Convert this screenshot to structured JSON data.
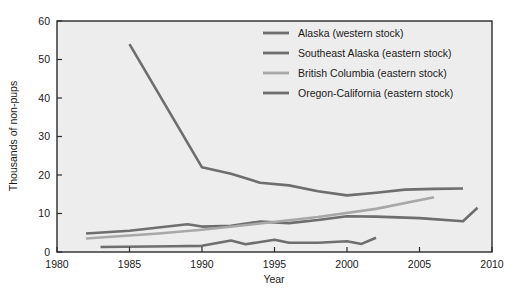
{
  "chart_data": {
    "type": "line",
    "title": "",
    "xlabel": "Year",
    "ylabel": "Thousands of non-pups",
    "xlim": [
      1980,
      2010
    ],
    "ylim": [
      0,
      60
    ],
    "xticks": [
      1980,
      1985,
      1990,
      1995,
      2000,
      2005,
      2010
    ],
    "yticks": [
      0,
      10,
      20,
      30,
      40,
      50,
      60
    ],
    "xtick_labels": [
      "1980",
      "1985",
      "1990",
      "1995",
      "2000",
      "2005",
      "2010"
    ],
    "ytick_labels": [
      "0",
      "10",
      "20",
      "30",
      "40",
      "50",
      "60"
    ],
    "grid": false,
    "legend_position": "upper-right-inside",
    "plot_background": "#ededed",
    "frame_color": "#2b2b2b",
    "series": [
      {
        "name": "Alaska (western stock)",
        "color": "#6e6e6e",
        "width": 2.6,
        "x": [
          1985,
          1990,
          1992,
          1994,
          1996,
          1998,
          2000,
          2002,
          2004,
          2006,
          2008
        ],
        "y": [
          54.0,
          22.0,
          20.3,
          18.0,
          17.3,
          15.8,
          14.7,
          15.4,
          16.2,
          16.4,
          16.5
        ]
      },
      {
        "name": "Southeast Alaska (eastern stock)",
        "color": "#6e6e6e",
        "width": 2.6,
        "x": [
          1982,
          1985,
          1989,
          1990,
          1992,
          1994,
          1996,
          1998,
          2000,
          2002,
          2005,
          2008,
          2009
        ],
        "y": [
          4.8,
          5.5,
          7.2,
          6.6,
          6.8,
          7.9,
          7.5,
          8.3,
          9.3,
          9.2,
          8.8,
          8.0,
          11.5
        ]
      },
      {
        "name": "British Columbia (eastern stock)",
        "color": "#a8a8a8",
        "width": 2.6,
        "x": [
          1982,
          1987,
          1990,
          1994,
          1998,
          2002,
          2006
        ],
        "y": [
          3.5,
          4.8,
          5.8,
          7.4,
          9.1,
          11.2,
          14.2
        ]
      },
      {
        "name": "Oregon-California (eastern stock)",
        "color": "#6e6e6e",
        "width": 2.6,
        "x": [
          1983,
          1988,
          1990,
          1992,
          1993,
          1995,
          1996,
          1998,
          2000,
          2001,
          2002
        ],
        "y": [
          1.3,
          1.5,
          1.6,
          3.0,
          2.0,
          3.2,
          2.4,
          2.4,
          2.8,
          2.1,
          3.7
        ]
      }
    ],
    "legend_entries": [
      {
        "label": "Alaska (western stock)",
        "color": "#6e6e6e"
      },
      {
        "label": "Southeast Alaska (eastern stock)",
        "color": "#6e6e6e"
      },
      {
        "label": "British Columbia (eastern stock)",
        "color": "#a8a8a8"
      },
      {
        "label": "Oregon-California (eastern stock)",
        "color": "#6e6e6e"
      }
    ]
  }
}
